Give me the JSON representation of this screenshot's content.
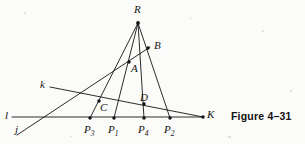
{
  "figure": {
    "caption": "Figure 4–31",
    "caption_pos": {
      "x": 231,
      "y": 111
    },
    "width": 305,
    "height": 144,
    "stroke_color": "#141414",
    "background": "#fbfbf9"
  },
  "points": [
    {
      "id": "R",
      "label": "R",
      "sub": "",
      "x": 138,
      "y": 23,
      "label_x": 134,
      "label_y": 4,
      "dot": true
    },
    {
      "id": "B",
      "label": "B",
      "sub": "",
      "x": 148,
      "y": 48,
      "label_x": 154,
      "label_y": 40,
      "dot": true
    },
    {
      "id": "A",
      "label": "A",
      "sub": "",
      "x": 129,
      "y": 62,
      "label_x": 131,
      "label_y": 63,
      "dot": true
    },
    {
      "id": "C",
      "label": "C",
      "sub": "",
      "x": 99,
      "y": 101,
      "label_x": 100,
      "label_y": 102,
      "dot": true
    },
    {
      "id": "D",
      "label": "D",
      "sub": "",
      "x": 144,
      "y": 104,
      "label_x": 140,
      "label_y": 92,
      "dot": true
    },
    {
      "id": "K",
      "label": "K",
      "sub": "",
      "x": 203,
      "y": 117,
      "label_x": 207,
      "label_y": 109,
      "dot": true
    },
    {
      "id": "P3",
      "label": "P",
      "sub": "3",
      "x": 90,
      "y": 118,
      "label_x": 84,
      "label_y": 124,
      "dot": true
    },
    {
      "id": "P1",
      "label": "P",
      "sub": "1",
      "x": 114,
      "y": 118,
      "label_x": 108,
      "label_y": 124,
      "dot": true
    },
    {
      "id": "P4",
      "label": "P",
      "sub": "4",
      "x": 144,
      "y": 118,
      "label_x": 138,
      "label_y": 124,
      "dot": true
    },
    {
      "id": "P2",
      "label": "P",
      "sub": "2",
      "x": 170,
      "y": 118,
      "label_x": 164,
      "label_y": 124,
      "dot": true
    }
  ],
  "line_labels": [
    {
      "id": "k",
      "label": "k",
      "label_x": 40,
      "label_y": 79
    },
    {
      "id": "l",
      "label": "l",
      "label_x": 5,
      "label_y": 110
    },
    {
      "id": "j",
      "label": "j",
      "label_x": 15,
      "label_y": 124
    }
  ],
  "segments": [
    {
      "name": "ray-R-P3",
      "x1": 138,
      "y1": 23,
      "x2": 90,
      "y2": 118
    },
    {
      "name": "ray-R-P1",
      "x1": 138,
      "y1": 23,
      "x2": 114,
      "y2": 118
    },
    {
      "name": "ray-R-P4",
      "x1": 138,
      "y1": 23,
      "x2": 144,
      "y2": 118
    },
    {
      "name": "ray-R-P2",
      "x1": 138,
      "y1": 23,
      "x2": 170,
      "y2": 118
    },
    {
      "name": "line-l",
      "x1": 12,
      "y1": 117,
      "x2": 203,
      "y2": 117
    },
    {
      "name": "line-j",
      "x1": 17,
      "y1": 135,
      "x2": 150,
      "y2": 47
    },
    {
      "name": "line-k",
      "x1": 50,
      "y1": 87,
      "x2": 203,
      "y2": 117
    }
  ],
  "specks": [
    {
      "x": 24,
      "y": 12,
      "w": 2,
      "h": 2
    },
    {
      "x": 262,
      "y": 30,
      "w": 2,
      "h": 2
    },
    {
      "x": 70,
      "y": 136,
      "w": 2,
      "h": 1
    },
    {
      "x": 228,
      "y": 136,
      "w": 3,
      "h": 2
    },
    {
      "x": 290,
      "y": 90,
      "w": 2,
      "h": 2
    },
    {
      "x": 190,
      "y": 18,
      "w": 2,
      "h": 1
    }
  ]
}
